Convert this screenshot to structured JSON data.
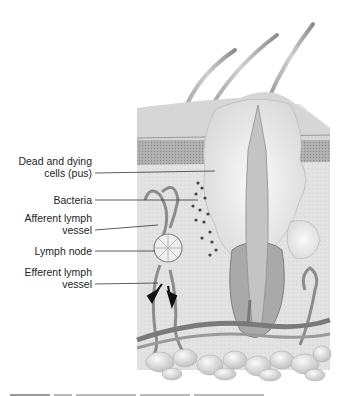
{
  "figure": {
    "labels": [
      {
        "id": "pus",
        "line1": "Dead and dying",
        "line2": "cells (pus)"
      },
      {
        "id": "bacteria",
        "line1": "Bacteria"
      },
      {
        "id": "afferent",
        "line1": "Afferent lymph",
        "line2": "vessel"
      },
      {
        "id": "node",
        "line1": "Lymph node"
      },
      {
        "id": "efferent",
        "line1": "Efferent lymph",
        "line2": "vessel"
      }
    ],
    "caption": "FIGURE 1x.x (illegible, cropped)"
  },
  "colors": {
    "background": "#ffffff",
    "skin_surface": "#d9d9d9",
    "epidermis": "#a8a8a8",
    "dermis": "#e4e4e4",
    "pus": "#f0f0f0",
    "vessels": "#8a8a8a",
    "fat": "#e8e8e8",
    "label_text": "#1e1e1e",
    "leader_line": "#333333"
  }
}
